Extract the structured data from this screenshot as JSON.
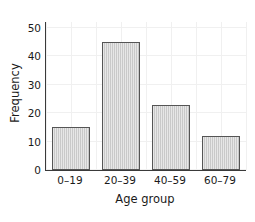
{
  "chart_data": {
    "type": "bar",
    "title": "",
    "subtitle": "",
    "categories": [
      "0–19",
      "20–39",
      "40–59",
      "60–79"
    ],
    "values": [
      15,
      45,
      23,
      12
    ],
    "xlabel": "Age group",
    "ylabel": "Frequency",
    "ylim": [
      0,
      52
    ],
    "yticks": [
      0,
      10,
      20,
      30,
      40,
      50
    ],
    "ytick_labels": [
      "0",
      "10",
      "20",
      "30",
      "40",
      "50"
    ],
    "grid": true,
    "legend": null,
    "annotations": [],
    "colors": {
      "bar_fill": "#c9c9c9",
      "bar_edge": "#555555",
      "axis": "#3a3a3a",
      "grid": "#f0f0f0",
      "text": "#1a1a1a",
      "background": "#ffffff"
    }
  }
}
